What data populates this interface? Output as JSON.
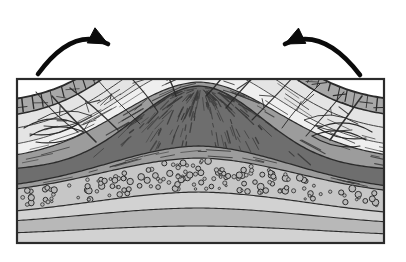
{
  "figure": {
    "kind": "geologic-cross-section",
    "title": "Anticline mountain geologic cross-section",
    "description": "Cross-section of a compressional fold mountain: sedimentary strata arched into an anticline with a fractured caprock summit, a dark foliated metamorphic core with radial schistosity, and a pebbly conglomerate bed beneath.",
    "canvas": {
      "width": 406,
      "height": 262,
      "background": "#ffffff"
    }
  },
  "frame": {
    "name": "cross-section-border",
    "x": 17,
    "y": 79,
    "width": 367,
    "height": 164,
    "stroke": "#2b2b2b",
    "stroke_width": 2.2
  },
  "palette": {
    "outline": "#2b2b2b",
    "arrow": "#0b0b0b",
    "caprock": "#a8a8a8",
    "caprock_summit": "#b2b2b2",
    "upper_light": "#e4e4e4",
    "upper_pale": "#efefef",
    "mid_gray": "#9c9c9c",
    "core_dark": "#6e6e6e",
    "conglomerate": "#c6c6c6",
    "lower_band": "#b8b8b8",
    "basement": "#d2d2d2",
    "hatch": "#3a3a3a",
    "clast_fill": "#b9b9b9",
    "clast_stroke": "#2e2e2e"
  },
  "arrows": [
    {
      "name": "compression-arrow-left",
      "label": "left compressional force",
      "direction": "up-right",
      "tail": {
        "x": 38,
        "y": 74
      },
      "head": {
        "x": 108,
        "y": 44
      },
      "color": "#0b0b0b"
    },
    {
      "name": "compression-arrow-right",
      "label": "right compressional force",
      "direction": "up-left",
      "tail": {
        "x": 360,
        "y": 75
      },
      "head": {
        "x": 285,
        "y": 44
      },
      "color": "#0b0b0b"
    }
  ],
  "layers": [
    {
      "name": "summit-caprock",
      "label": "Fractured blocky caprock",
      "fill": "#a8a8a8",
      "pattern": "blocky-joints",
      "order": 1
    },
    {
      "name": "upper-light-strata",
      "label": "Light upper sedimentary strata",
      "fill": "#e4e4e4",
      "pattern": "thin-bedding-lines",
      "order": 2
    },
    {
      "name": "mid-gray-strata",
      "label": "Medium gray strata",
      "fill": "#9c9c9c",
      "pattern": "sparse-dashes",
      "order": 3
    },
    {
      "name": "metamorphic-core",
      "label": "Dark foliated metamorphic core",
      "fill": "#6e6e6e",
      "pattern": "radial-schistosity",
      "order": 4
    },
    {
      "name": "conglomerate-bed",
      "label": "Conglomerate with rounded clasts",
      "fill": "#c6c6c6",
      "pattern": "pebble-circles",
      "order": 5
    },
    {
      "name": "lower-band",
      "label": "Lower folded band",
      "fill": "#b8b8b8",
      "pattern": "plain",
      "order": 6
    },
    {
      "name": "basement-strata",
      "label": "Basal strata",
      "fill": "#d2d2d2",
      "pattern": "plain",
      "order": 7
    }
  ],
  "clasts": {
    "name": "conglomerate-clasts",
    "count": 168,
    "radius_range": [
      1.1,
      3.4
    ],
    "fill": "#b9b9b9",
    "stroke": "#2e2e2e"
  },
  "structure": {
    "fold_type": "anticline",
    "apex": {
      "x": 199,
      "y": 11
    },
    "limb_left_base": {
      "x": 17,
      "y": 96
    },
    "limb_right_base": {
      "x": 384,
      "y": 98
    },
    "core_apex": {
      "x": 196,
      "y": 86
    }
  }
}
